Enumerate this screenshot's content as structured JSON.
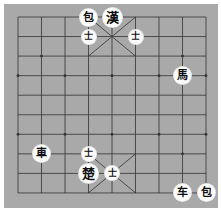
{
  "game": "xiangqi",
  "colors": {
    "board": "#a9a9a9",
    "line": "#333333",
    "piece_bg": "#ffffff",
    "piece_text": "#111111"
  },
  "grid": {
    "x0": 18,
    "y0": 17,
    "dx": 23.5,
    "dy": 19.55,
    "cols": 9,
    "rows": 10
  },
  "pieces": [
    {
      "char": "包",
      "col": 3,
      "row": 0,
      "size": "normal"
    },
    {
      "char": "漢",
      "col": 4,
      "row": 0,
      "size": "big"
    },
    {
      "char": "士",
      "col": 3,
      "row": 1,
      "size": "small"
    },
    {
      "char": "士",
      "col": 5,
      "row": 1,
      "size": "small"
    },
    {
      "char": "馬",
      "col": 7,
      "row": 3,
      "size": "normal"
    },
    {
      "char": "車",
      "col": 1,
      "row": 7,
      "size": "normal"
    },
    {
      "char": "士",
      "col": 3,
      "row": 7,
      "size": "small"
    },
    {
      "char": "楚",
      "col": 3,
      "row": 8,
      "size": "big"
    },
    {
      "char": "士",
      "col": 4,
      "row": 8,
      "size": "small"
    },
    {
      "char": "车",
      "col": 7,
      "row": 9,
      "size": "normal"
    },
    {
      "char": "包",
      "col": 8,
      "row": 9,
      "size": "normal"
    }
  ]
}
